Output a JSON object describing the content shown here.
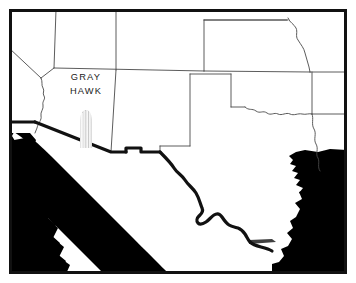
{
  "figure": {
    "kind": "map",
    "background_color": "#ffffff",
    "ink_color": "#000000",
    "line_color": "#4a4a4a",
    "frame": {
      "color": "#111111",
      "thickness_px": 3,
      "inset_px": 6
    }
  },
  "place_label": {
    "line1": "GRAY",
    "line2": "HAWK",
    "color": "#1a1a1a",
    "region": "Arizona"
  },
  "symbol": {
    "name": "saguaro-cactus",
    "fill_color": "#c9c9c9",
    "stripe_color": "#ffffff",
    "description": "ribbed gray columnar cactus marker placed south of the GRAY HAWK label"
  },
  "water_bodies": [
    {
      "name": "Pacific Ocean",
      "fill": "#000000"
    },
    {
      "name": "Gulf of California",
      "fill": "#000000"
    },
    {
      "name": "Gulf of Mexico",
      "fill": "#000000"
    }
  ],
  "landforms": [
    {
      "name": "Baja California Peninsula",
      "fill": "#ffffff"
    }
  ],
  "boundaries": [
    {
      "name": "state-borders",
      "style": "thin",
      "color": "#4a4a4a",
      "width_px": 0.9
    },
    {
      "name": "international-border-rio-grande",
      "style": "thick",
      "color": "#111111",
      "width_px": 3.2
    }
  ],
  "states_depicted": [
    "California",
    "Nevada",
    "Utah",
    "Arizona",
    "Colorado",
    "New Mexico",
    "Kansas",
    "Oklahoma",
    "Texas"
  ]
}
